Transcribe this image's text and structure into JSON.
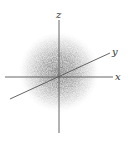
{
  "diagram": {
    "axes": {
      "x": {
        "label": "x"
      },
      "y": {
        "label": "y"
      },
      "z": {
        "label": "z"
      }
    },
    "colors": {
      "axis": "#555555",
      "cloud": "#8a8a8a",
      "label": "#333333",
      "background": "#ffffff"
    }
  }
}
